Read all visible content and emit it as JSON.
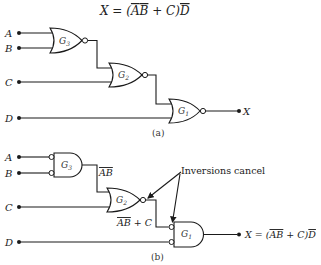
{
  "title": {
    "equation_parts": [
      "X = (",
      "A",
      "B",
      " + C)",
      "D"
    ],
    "overlined": [
      "A",
      "B",
      "D"
    ]
  },
  "diagram_a": {
    "caption": "(a)",
    "inputs": [
      "A",
      "B",
      "C",
      "D"
    ],
    "output": "X",
    "gates": [
      {
        "id": "G3",
        "name": "G",
        "sub": "3",
        "type": "NOR"
      },
      {
        "id": "G2",
        "name": "G",
        "sub": "2",
        "type": "NOR"
      },
      {
        "id": "G1",
        "name": "G",
        "sub": "1",
        "type": "NOR"
      }
    ]
  },
  "diagram_b": {
    "caption": "(b)",
    "inputs": [
      "A",
      "B",
      "C",
      "D"
    ],
    "gates": [
      {
        "id": "G3",
        "name": "G",
        "sub": "3",
        "type": "AND with inverted inputs"
      },
      {
        "id": "G2",
        "name": "G",
        "sub": "2",
        "type": "NOR"
      },
      {
        "id": "G1",
        "name": "G",
        "sub": "1",
        "type": "AND with inverted inputs"
      }
    ],
    "g3_output_label": "AB",
    "g2_output_label_a": "AB",
    "g2_output_label_b": " + C",
    "annotation": "Inversions cancel",
    "output_eq_prefix": "X = (",
    "output_eq_ab": "AB",
    "output_eq_mid": " + C)",
    "output_eq_d": "D"
  }
}
